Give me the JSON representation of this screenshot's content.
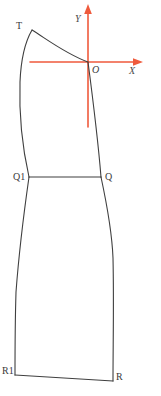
{
  "figure": {
    "background_color": "#ffffff",
    "width": 161,
    "height": 396,
    "outline_color": "#3f3f3f",
    "axis_color": "#ef5a3c",
    "label_color": "#3a3a3a"
  },
  "axes": {
    "x_label": "X",
    "y_label": "Y",
    "origin_label": "O",
    "x_axis": {
      "x1": 30,
      "y1": 62,
      "x2": 143,
      "y2": 62,
      "arrow": "right"
    },
    "y_axis": {
      "x1": 88,
      "y1": 5,
      "x2": 88,
      "y2": 127,
      "arrow": "up"
    },
    "origin": {
      "x": 88,
      "y": 62
    }
  },
  "points": [
    {
      "name": "T",
      "label": "T",
      "x": 32,
      "y": 30
    },
    {
      "name": "O",
      "label": "O",
      "x": 88,
      "y": 62
    },
    {
      "name": "Q1",
      "label": "Q1",
      "x": 29,
      "y": 177
    },
    {
      "name": "Q",
      "label": "Q",
      "x": 101,
      "y": 177
    },
    {
      "name": "R1",
      "label": "R1",
      "x": 15,
      "y": 375
    },
    {
      "name": "R",
      "label": "R",
      "x": 113,
      "y": 381
    }
  ],
  "paths": {
    "shoulder_curve": "M 32 30 C 48 40, 66 54, 88 62",
    "left_side_seam": "M 32 30 C 25 42, 21 58, 20 82 C 19 112, 22 146, 29 177",
    "right_side_seam": "M 88 62 C 93 100, 98 140, 101 177",
    "waist_line": "M 29 177 L 101 177",
    "left_skirt_seam": "M 29 177 C 24 212, 19 252, 16 292 C 15 325, 15 355, 15 375",
    "right_skirt_seam": "M 101 177 C 107 205, 112 232, 113 258 C 114 300, 113 345, 113 381",
    "hem_line": "M 15 375 L 113 381"
  }
}
